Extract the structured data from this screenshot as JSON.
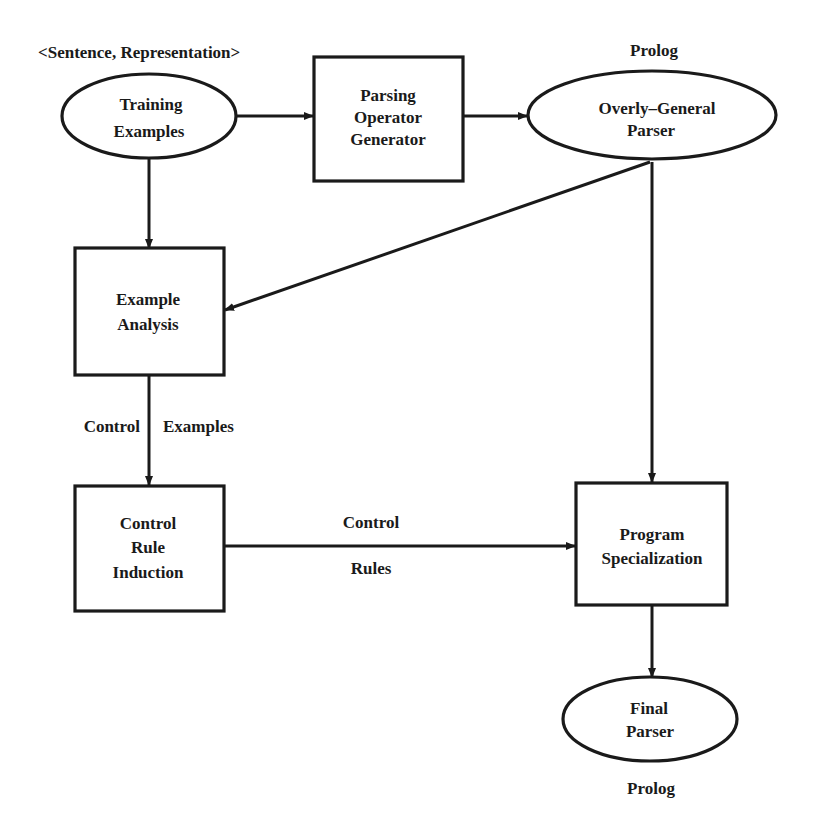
{
  "diagram": {
    "nodes": {
      "training_examples": {
        "shape": "ellipse",
        "line1": "Training",
        "line2": "Examples",
        "annotation": "<Sentence, Representation>"
      },
      "parsing_operator_generator": {
        "shape": "box",
        "line1": "Parsing",
        "line2": "Operator",
        "line3": "Generator"
      },
      "overly_general_parser": {
        "shape": "ellipse",
        "line1": "Overly–General",
        "line2": "Parser",
        "annotation": "Prolog"
      },
      "example_analysis": {
        "shape": "box",
        "line1": "Example",
        "line2": "Analysis"
      },
      "control_rule_induction": {
        "shape": "box",
        "line1": "Control",
        "line2": "Rule",
        "line3": "Induction"
      },
      "program_specialization": {
        "shape": "box",
        "line1": "Program",
        "line2": "Specialization"
      },
      "final_parser": {
        "shape": "ellipse",
        "line1": "Final",
        "line2": "Parser",
        "annotation": "Prolog"
      }
    },
    "edges": [
      {
        "from": "training_examples",
        "to": "parsing_operator_generator"
      },
      {
        "from": "parsing_operator_generator",
        "to": "overly_general_parser"
      },
      {
        "from": "training_examples",
        "to": "example_analysis"
      },
      {
        "from": "overly_general_parser",
        "to": "example_analysis"
      },
      {
        "from": "overly_general_parser",
        "to": "program_specialization"
      },
      {
        "from": "example_analysis",
        "to": "control_rule_induction",
        "label_left": "Control",
        "label_right": "Examples"
      },
      {
        "from": "control_rule_induction",
        "to": "program_specialization",
        "label_top": "Control",
        "label_bottom": "Rules"
      },
      {
        "from": "program_specialization",
        "to": "final_parser"
      }
    ]
  }
}
